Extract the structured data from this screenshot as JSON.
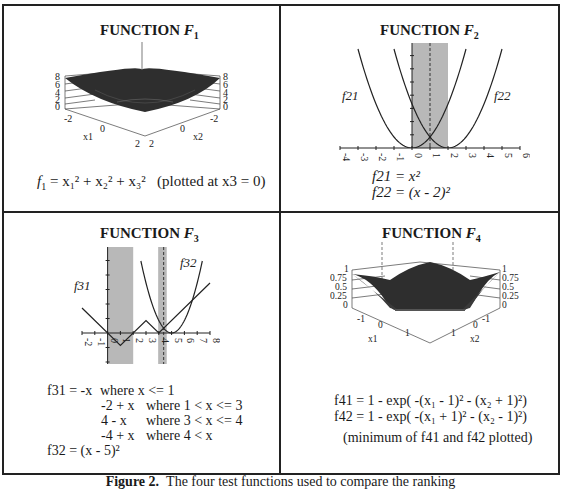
{
  "figure": {
    "caption_label": "Figure 2.",
    "caption_text": "The four test functions used to compare the ranking"
  },
  "panels": {
    "f1": {
      "title_prefix": "FUNCTION ",
      "title_var": "F",
      "title_sub": "1",
      "equation": {
        "lhs": "f",
        "lhs_sub": "1",
        "rhs": "= x₁² + x₂² + x₃²",
        "note": "(plotted at x3 = 0)"
      },
      "axes": {
        "z_ticks": [
          "8",
          "6",
          "4",
          "2",
          "0"
        ],
        "x1_label": "x1",
        "x2_label": "x2",
        "x1_ticks": [
          "-2",
          "0",
          "2"
        ],
        "x2_ticks": [
          "-2",
          "0",
          "2"
        ]
      }
    },
    "f2": {
      "title_prefix": "FUNCTION ",
      "title_var": "F",
      "title_sub": "2",
      "curve_labels": [
        "f21",
        "f22"
      ],
      "equations": [
        "f21 = x²",
        "f22 = (x - 2)²"
      ]
    },
    "f3": {
      "title_prefix": "FUNCTION ",
      "title_var": "F",
      "title_sub": "3",
      "curve_labels": [
        "f31",
        "f32"
      ],
      "equations": [
        {
          "lhs": "f31 = -x",
          "cond": "where x <= 1"
        },
        {
          "lhs": "-2 + x",
          "cond": "where 1 < x <= 3"
        },
        {
          "lhs": "4 - x",
          "cond": "where 3 < x <= 4"
        },
        {
          "lhs": "-4 + x",
          "cond": "where 4 < x"
        },
        {
          "lhs": "f32 = (x - 5)²",
          "cond": ""
        }
      ]
    },
    "f4": {
      "title_prefix": "FUNCTION ",
      "title_var": "F",
      "title_sub": "4",
      "equations": [
        "f41 = 1 - exp( -(x₁ - 1)² - (x₂ + 1)²)",
        "f42 = 1 - exp( -(x₁ + 1)² - (x₂ - 1)²)"
      ],
      "note": "(minimum of f41 and f42 plotted)",
      "axes": {
        "z_ticks": [
          "1",
          "0.75",
          "0.5",
          "0.25",
          "0"
        ],
        "x1_label": "x1",
        "x2_label": "x2",
        "x1_ticks": [
          "-1",
          "0",
          "1"
        ],
        "x2_ticks": [
          "-1",
          "0",
          "1"
        ]
      }
    }
  },
  "chart_data": [
    {
      "type": "line",
      "title": "FUNCTION F2",
      "xlabel": "",
      "ylabel": "",
      "xlim": [
        -4,
        6
      ],
      "x_ticks": [
        -4,
        -3,
        -2,
        -1,
        0,
        1,
        2,
        3,
        4,
        5,
        6
      ],
      "series": [
        {
          "name": "f21",
          "formula": "x^2",
          "x_range": [
            -3,
            3
          ]
        },
        {
          "name": "f22",
          "formula": "(x-2)^2",
          "x_range": [
            -1,
            5
          ]
        }
      ],
      "shaded_regions": [
        [
          0,
          2
        ]
      ],
      "dashed_lines": [
        1
      ]
    },
    {
      "type": "line",
      "title": "FUNCTION F3",
      "xlabel": "",
      "ylabel": "",
      "xlim": [
        -2,
        8
      ],
      "x_ticks": [
        -2,
        -1,
        0,
        1,
        2,
        3,
        4,
        5,
        6,
        7,
        8
      ],
      "series": [
        {
          "name": "f31",
          "points": [
            [
              -2,
              2
            ],
            [
              1,
              -1
            ],
            [
              3,
              1
            ],
            [
              4,
              0
            ],
            [
              8,
              4
            ]
          ]
        },
        {
          "name": "f32",
          "formula": "(x-5)^2",
          "x_range": [
            2.6,
            7.4
          ]
        }
      ],
      "shaded_regions": [
        [
          0,
          2
        ],
        [
          3.95,
          4.62
        ]
      ],
      "dashed_lines": [
        4.38
      ]
    }
  ]
}
